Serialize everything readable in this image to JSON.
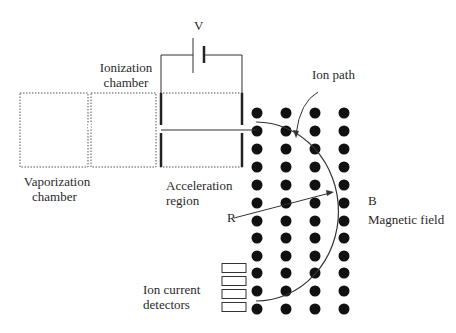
{
  "labels": {
    "voltage": "V",
    "ionization_chamber_line1": "Ionization",
    "ionization_chamber_line2": "chamber",
    "vaporization_chamber_line1": "Vaporization",
    "vaporization_chamber_line2": "chamber",
    "acceleration_region_line1": "Acceleration",
    "acceleration_region_line2": "region",
    "ion_path": "Ion path",
    "radius": "R",
    "field_symbol": "B",
    "magnetic_field": "Magnetic field",
    "ion_current_detectors_line1": "Ion current",
    "ion_current_detectors_line2": "detectors"
  },
  "field_grid": {
    "columns_x": [
      257,
      286,
      315,
      344
    ],
    "rows_y": [
      113,
      131,
      149,
      167,
      185,
      203,
      221,
      238,
      256,
      273,
      291,
      309
    ],
    "dot_radius": 5.5,
    "dot_color": "#111111"
  },
  "detectors": {
    "count": 4,
    "x": 222,
    "width": 24,
    "height": 9,
    "rows_y": [
      268,
      281,
      294,
      307
    ]
  },
  "colors": {
    "line": "#333333",
    "dotted": "#555555",
    "text": "#2a2a2a"
  }
}
